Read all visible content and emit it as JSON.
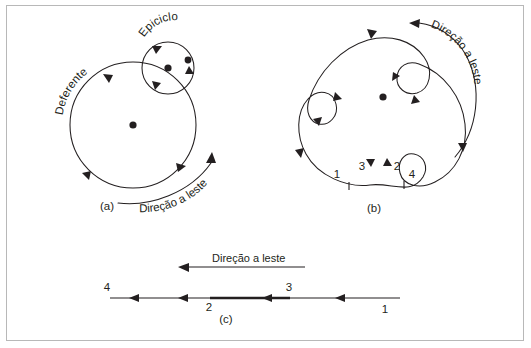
{
  "figure": {
    "title_present": false,
    "language": "pt-BR",
    "background_color": "#ffffff",
    "ink_color": "#231f20",
    "border_color": "#b8b8b8"
  },
  "panel_a": {
    "label": "(a)",
    "deferent_label": "Deferente",
    "epicycle_label": "Epiciclo",
    "direction_label": "Direção a leste",
    "center_dot": true,
    "epicycle_center_dot": true,
    "planet_dot": true,
    "deferent_arrow_count": 3,
    "epicycle_arrow_count": 3
  },
  "panel_b": {
    "label": "(b)",
    "direction_label": "Direção a leste",
    "center_dot": true,
    "loop_count": 3,
    "tick_numbers": [
      "1",
      "3",
      "2",
      "4"
    ],
    "tick_number_1": "1",
    "tick_number_2": "2",
    "tick_number_3": "3",
    "tick_number_4": "4"
  },
  "panel_c": {
    "label": "(c)",
    "direction_label": "Direção a leste",
    "tick_number_1": "1",
    "tick_number_2": "2",
    "tick_number_3": "3",
    "tick_number_4": "4",
    "retrograde_segment_highlighted": true
  }
}
